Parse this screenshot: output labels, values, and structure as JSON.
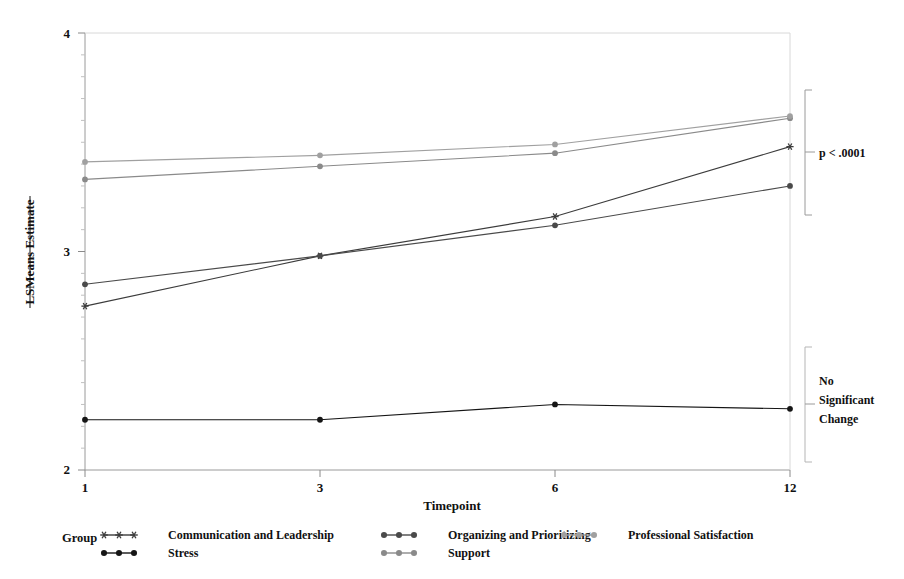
{
  "chart_data": {
    "type": "line",
    "title": "",
    "xlabel": "Timepoint",
    "ylabel": "LSMeans Estimate",
    "categories": [
      "1",
      "3",
      "6",
      "12"
    ],
    "x": [
      1,
      3,
      6,
      12
    ],
    "ylim": [
      2,
      4
    ],
    "xlim_categorical": true,
    "y_ticks_major": [
      "2",
      "3",
      "4"
    ],
    "y_ticks_major_values": [
      2,
      3,
      4
    ],
    "y_minor_tick_count_per_unit": 9,
    "grid": false,
    "legend_position": "bottom",
    "legend_title": "Group",
    "series": [
      {
        "name": "Communication and Leadership",
        "marker": "asterisk",
        "color": "#3c3c3c",
        "values": [
          2.75,
          2.98,
          3.16,
          3.48
        ]
      },
      {
        "name": "Stress",
        "marker": "circle-filled",
        "color": "#151515",
        "values": [
          2.23,
          2.23,
          2.3,
          2.28
        ]
      },
      {
        "name": "Organizing and Prioritizing",
        "marker": "circle-filled",
        "color": "#4a4a4a",
        "values": [
          2.85,
          2.98,
          3.12,
          3.3
        ]
      },
      {
        "name": "Support",
        "marker": "circle-filled",
        "color": "#8a8a8a",
        "values": [
          3.33,
          3.39,
          3.45,
          3.61
        ]
      },
      {
        "name": "Professional Satisfaction",
        "marker": "circle-filled",
        "color": "#a0a0a0",
        "values": [
          3.41,
          3.44,
          3.49,
          3.62
        ]
      }
    ],
    "annotations": [
      {
        "id": "p-value-bracket",
        "text": "p < .0001",
        "lines": [
          "p < .0001"
        ],
        "spans_y": [
          3.63,
          3.17
        ]
      },
      {
        "id": "no-change-bracket",
        "text": "No Significant Change",
        "lines": [
          "No",
          "Significant",
          "Change"
        ],
        "spans_y": [
          2.55,
          2.02
        ]
      }
    ]
  },
  "axis": {
    "y_label": "LSMeans Estimate",
    "x_label": "Timepoint",
    "y_tick_labels": [
      "4",
      "3",
      "2"
    ],
    "x_tick_labels": [
      "1",
      "3",
      "6",
      "12"
    ]
  },
  "legend": {
    "title": "Group",
    "entries": [
      {
        "label": "Communication and Leadership",
        "marker": "asterisk",
        "color": "#3c3c3c"
      },
      {
        "label": "Stress",
        "marker": "circle-filled",
        "color": "#151515"
      },
      {
        "label": "Organizing and Prioritizing",
        "marker": "circle-filled",
        "color": "#4a4a4a"
      },
      {
        "label": "Support",
        "marker": "circle-filled",
        "color": "#8a8a8a"
      },
      {
        "label": "Professional Satisfaction",
        "marker": "circle-filled",
        "color": "#a0a0a0"
      }
    ]
  },
  "annotations": {
    "p_value": "p < .0001",
    "no_change_line1": "No",
    "no_change_line2": "Significant",
    "no_change_line3": "Change"
  },
  "colors": {
    "axis": "#9a9a9a",
    "text": "#111111",
    "background": "#ffffff"
  }
}
